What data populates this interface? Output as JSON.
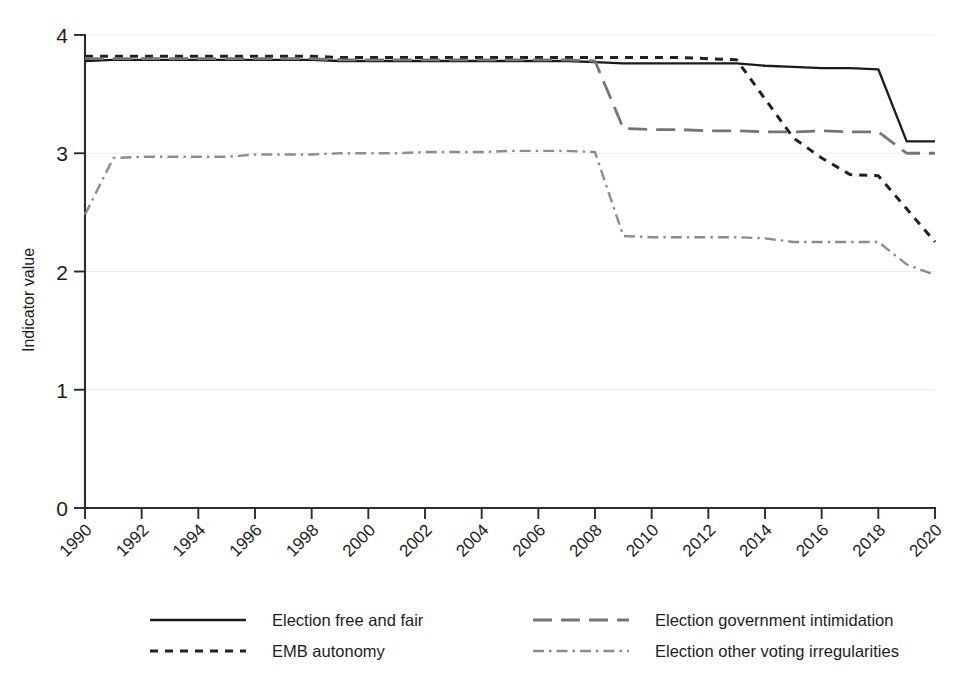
{
  "chart_data": {
    "type": "line",
    "title": "",
    "xlabel": "",
    "ylabel": "Indicator value",
    "xlim": [
      1990,
      2020
    ],
    "ylim": [
      0,
      4
    ],
    "ytick_labels": [
      "0",
      "1",
      "2",
      "3",
      "4"
    ],
    "ytick_values": [
      0,
      1,
      2,
      3,
      4
    ],
    "xtick_labels": [
      "1990",
      "1992",
      "1994",
      "1996",
      "1998",
      "2000",
      "2002",
      "2004",
      "2006",
      "2008",
      "2010",
      "2012",
      "2014",
      "2016",
      "2018",
      "2020"
    ],
    "xtick_values": [
      1990,
      1992,
      1994,
      1996,
      1998,
      2000,
      2002,
      2004,
      2006,
      2008,
      2010,
      2012,
      2014,
      2016,
      2018,
      2020
    ],
    "grid": true,
    "legend_position": "bottom",
    "series": [
      {
        "name": "Election free and fair",
        "style": "solid",
        "color": "#1b1b1b",
        "x": [
          1990,
          1991,
          1992,
          1993,
          1994,
          1995,
          1996,
          1997,
          1998,
          1999,
          2000,
          2001,
          2002,
          2003,
          2004,
          2005,
          2006,
          2007,
          2008,
          2009,
          2010,
          2011,
          2012,
          2013,
          2014,
          2015,
          2016,
          2017,
          2018,
          2019,
          2020
        ],
        "values": [
          3.78,
          3.79,
          3.79,
          3.79,
          3.79,
          3.79,
          3.79,
          3.79,
          3.79,
          3.78,
          3.78,
          3.78,
          3.78,
          3.78,
          3.78,
          3.78,
          3.78,
          3.78,
          3.77,
          3.76,
          3.76,
          3.76,
          3.76,
          3.76,
          3.74,
          3.73,
          3.72,
          3.72,
          3.71,
          3.1,
          3.1
        ]
      },
      {
        "name": "EMB autonomy",
        "style": "dashed",
        "color": "#212121",
        "x": [
          1990,
          1991,
          1992,
          1993,
          1994,
          1995,
          1996,
          1997,
          1998,
          1999,
          2000,
          2001,
          2002,
          2003,
          2004,
          2005,
          2006,
          2007,
          2008,
          2009,
          2010,
          2011,
          2012,
          2013,
          2014,
          2015,
          2016,
          2017,
          2018,
          2019,
          2020
        ],
        "values": [
          3.82,
          3.82,
          3.82,
          3.82,
          3.82,
          3.82,
          3.82,
          3.82,
          3.82,
          3.81,
          3.81,
          3.81,
          3.81,
          3.81,
          3.81,
          3.81,
          3.81,
          3.81,
          3.81,
          3.81,
          3.81,
          3.81,
          3.8,
          3.79,
          3.46,
          3.13,
          2.96,
          2.82,
          2.81,
          2.53,
          2.25
        ]
      },
      {
        "name": "Election government intimidation",
        "style": "long-dashed",
        "color": "#757575",
        "x": [
          1990,
          1991,
          1992,
          1993,
          1994,
          1995,
          1996,
          1997,
          1998,
          1999,
          2000,
          2001,
          2002,
          2003,
          2004,
          2005,
          2006,
          2007,
          2008,
          2009,
          2010,
          2011,
          2012,
          2013,
          2014,
          2015,
          2016,
          2017,
          2018,
          2019,
          2020
        ],
        "values": [
          3.8,
          3.8,
          3.8,
          3.8,
          3.8,
          3.8,
          3.8,
          3.8,
          3.8,
          3.79,
          3.79,
          3.79,
          3.79,
          3.79,
          3.79,
          3.79,
          3.79,
          3.79,
          3.78,
          3.21,
          3.2,
          3.2,
          3.19,
          3.19,
          3.18,
          3.18,
          3.19,
          3.18,
          3.18,
          3.0,
          3.0
        ]
      },
      {
        "name": "Election other voting irregularities",
        "style": "dash-dot",
        "color": "#8d8d8d",
        "x": [
          1990,
          1991,
          1992,
          1993,
          1994,
          1995,
          1996,
          1997,
          1998,
          1999,
          2000,
          2001,
          2002,
          2003,
          2004,
          2005,
          2006,
          2007,
          2008,
          2009,
          2010,
          2011,
          2012,
          2013,
          2014,
          2015,
          2016,
          2017,
          2018,
          2019,
          2020
        ],
        "values": [
          2.48,
          2.96,
          2.97,
          2.97,
          2.97,
          2.97,
          2.99,
          2.99,
          2.99,
          3.0,
          3.0,
          3.0,
          3.01,
          3.01,
          3.01,
          3.02,
          3.02,
          3.02,
          3.01,
          2.3,
          2.29,
          2.29,
          2.29,
          2.29,
          2.28,
          2.25,
          2.25,
          2.25,
          2.25,
          2.06,
          1.97
        ]
      }
    ]
  },
  "legend": {
    "items": [
      {
        "label": "Election free and fair",
        "style": "solid"
      },
      {
        "label": "Election government intimidation",
        "style": "long-dashed"
      },
      {
        "label": "EMB autonomy",
        "style": "dashed"
      },
      {
        "label": "Election other voting irregularities",
        "style": "dash-dot"
      }
    ]
  }
}
